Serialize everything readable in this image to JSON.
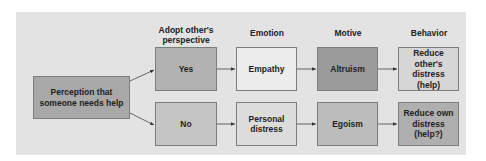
{
  "diagram": {
    "headers": {
      "perspective": "Adopt other's perspective",
      "emotion": "Emotion",
      "motive": "Motive",
      "behavior": "Behavior"
    },
    "start": {
      "label": "Perception that someone needs help",
      "color": "#a8a8a8"
    },
    "rows": [
      {
        "perspective": {
          "label": "Yes",
          "color": "#b2b2b2"
        },
        "emotion": {
          "label": "Empathy",
          "color": "#ececec"
        },
        "motive": {
          "label": "Altruism",
          "color": "#9b9b9b"
        },
        "behavior": {
          "label": "Reduce other's distress (help)",
          "color": "#d6d6d6"
        }
      },
      {
        "perspective": {
          "label": "No",
          "color": "#c5c5c5"
        },
        "emotion": {
          "label": "Personal distress",
          "color": "#dcdcdc"
        },
        "motive": {
          "label": "Egoism",
          "color": "#bcbcbc"
        },
        "behavior": {
          "label": "Reduce own distress (help?)",
          "color": "#afafaf"
        }
      }
    ],
    "panel_color": "#e3e3e3",
    "arrow_color": "#333333"
  }
}
